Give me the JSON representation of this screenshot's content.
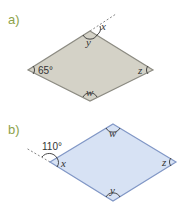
{
  "figures": [
    {
      "part_label": "a)",
      "fill": "#d4d2c7",
      "stroke": "#8c8b82",
      "vertices": {
        "top": [
          90,
          31
        ],
        "right": [
          153,
          70
        ],
        "bottom": [
          90,
          101
        ],
        "left": [
          28,
          70
        ]
      },
      "angles": {
        "left": "65°",
        "top_interior": "y",
        "top_exterior": "x",
        "right": "z",
        "bottom": "w"
      }
    },
    {
      "part_label": "b)",
      "fill": "#d7e2f4",
      "stroke": "#8197c6",
      "vertices": {
        "top": [
          113,
          124
        ],
        "right": [
          176,
          162
        ],
        "bottom": [
          113,
          201
        ],
        "left": [
          50,
          162
        ]
      },
      "angles": {
        "left_exterior": "110°",
        "left_interior": "x",
        "top": "w",
        "right": "z",
        "bottom": "y"
      }
    }
  ]
}
